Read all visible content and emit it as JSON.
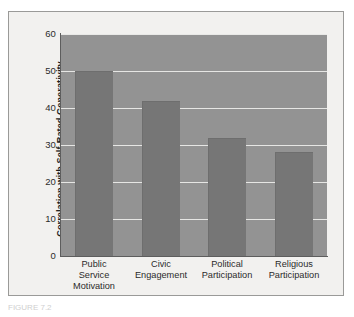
{
  "figure": {
    "caption_fragment": "FIGURE 7.2"
  },
  "chart_data": {
    "type": "bar",
    "title": "",
    "xlabel": "",
    "ylabel": "Correlation with Self-Rated Generativity",
    "categories": [
      "Public Service Motivation",
      "Civic Engagement",
      "Political Participation",
      "Religious Participation"
    ],
    "category_lines": [
      [
        "Public",
        "Service",
        "Motivation"
      ],
      [
        "Civic",
        "Engagement"
      ],
      [
        "Political",
        "Participation"
      ],
      [
        "Religious",
        "Participation"
      ]
    ],
    "values": [
      50,
      42,
      32,
      28
    ],
    "ylim": [
      0,
      60
    ],
    "yticks": [
      0,
      10,
      20,
      30,
      40,
      50,
      60
    ],
    "ytick_labels": [
      "0",
      "10",
      "20",
      "30",
      "40",
      "50",
      "60"
    ],
    "grid": true,
    "legend": null,
    "colors": {
      "bar": "#767676",
      "plot_background": "#939393",
      "gridline": "#e6e6e4",
      "axis": "#5d5d5d",
      "page_background": "#f2f1ef",
      "frame_border": "#9a9a98",
      "text": "#2b2b2b"
    }
  }
}
